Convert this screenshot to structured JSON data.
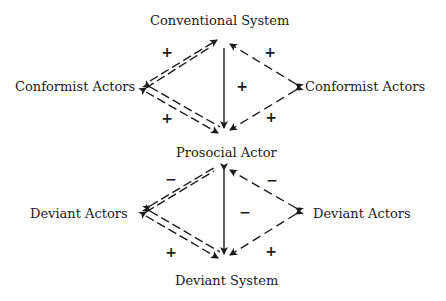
{
  "diagram": {
    "type": "double-diamond relational model",
    "upper_diamond": {
      "top_node": "Conventional System",
      "left_node": "Conformist Actors",
      "right_node": "Conformist Actors",
      "bottom_node": "Prosocial Actor",
      "signs": {
        "top_left_edge": "+",
        "top_right_edge": "+",
        "center_vertical": "+",
        "bottom_left_edge": "+",
        "bottom_right_edge": "+"
      }
    },
    "lower_diamond": {
      "top_node": "Prosocial Actor",
      "left_node": "Deviant Actors",
      "right_node": "Deviant Actors",
      "bottom_node": "Deviant System",
      "signs": {
        "top_left_edge": "−",
        "top_right_edge": "−",
        "center_vertical": "−",
        "bottom_left_edge": "+",
        "bottom_right_edge": "+"
      }
    },
    "edge_styles": {
      "left_edges": "double-dashed",
      "right_edges": "single-dashed",
      "center": "solid arrow downward"
    },
    "colors": {
      "ink": "#1a1a1a",
      "background": "#ffffff"
    }
  }
}
